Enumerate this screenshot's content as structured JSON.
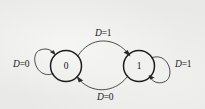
{
  "diagram": {
    "background_color": "#e9e9e7",
    "stroke_color": "#2a2a2a",
    "states": [
      {
        "id": "state-0",
        "label": "0",
        "cx": 66,
        "cy": 66,
        "r": 15.5
      },
      {
        "id": "state-1",
        "label": "1",
        "cx": 139,
        "cy": 66,
        "r": 15.5
      }
    ],
    "transitions": [
      {
        "id": "self-loop-left",
        "from": "state-0",
        "to": "state-0",
        "label_var": "D",
        "label_eq": "=",
        "label_value": "0",
        "label_text": "D=0",
        "label_position": "left"
      },
      {
        "id": "arc-top",
        "from": "state-0",
        "to": "state-1",
        "label_var": "D",
        "label_eq": "=",
        "label_value": "1",
        "label_text": "D=1",
        "label_position": "top"
      },
      {
        "id": "arc-bottom",
        "from": "state-1",
        "to": "state-0",
        "label_var": "D",
        "label_eq": "=",
        "label_value": "0",
        "label_text": "D=0",
        "label_position": "bottom"
      },
      {
        "id": "self-loop-right",
        "from": "state-1",
        "to": "state-1",
        "label_var": "D",
        "label_eq": "=",
        "label_value": "1",
        "label_text": "D=1",
        "label_position": "right"
      }
    ]
  }
}
